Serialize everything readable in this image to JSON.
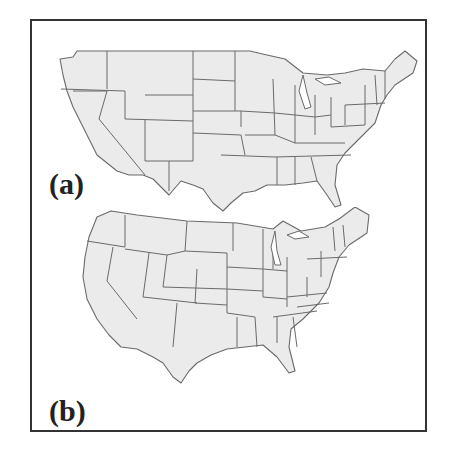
{
  "figure": {
    "panels": [
      {
        "id": "a",
        "label": "(a)",
        "description": "Map of the contiguous United States with state boundaries (projection a)"
      },
      {
        "id": "b",
        "label": "(b)",
        "description": "Map of the contiguous United States with state boundaries (projection b)"
      }
    ]
  },
  "colors": {
    "land": "#ebebeb",
    "border": "#6a6a6a",
    "frame": "#333333",
    "background": "#ffffff"
  }
}
